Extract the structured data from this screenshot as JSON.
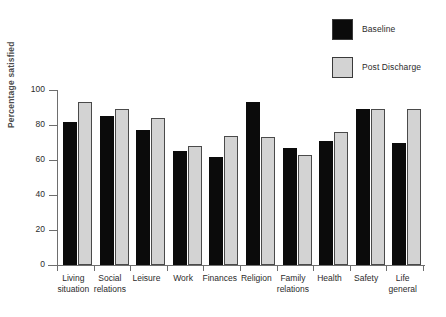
{
  "legend": {
    "position": "top-right",
    "items": [
      {
        "label": "Baseline",
        "color": "#0b0b0b",
        "swatch_name": "baseline-swatch"
      },
      {
        "label": "Post Discharge",
        "color": "#d3d3d3",
        "swatch_name": "post-discharge-swatch"
      }
    ]
  },
  "axes": {
    "y_title": "Percentage satisfied",
    "y_ticks": [
      "0",
      "20",
      "40",
      "60",
      "80",
      "100"
    ]
  },
  "chart_data": {
    "type": "bar",
    "title": "",
    "subtitle": "",
    "xlabel": "",
    "ylabel": "Percentage satisfied",
    "ylim": [
      0,
      100
    ],
    "yticks": [
      0,
      20,
      40,
      60,
      80,
      100
    ],
    "grid": false,
    "legend_position": "top-right",
    "categories": [
      "Living\nsituation",
      "Social\nrelations",
      "Leisure",
      "Work",
      "Finances",
      "Religion",
      "Family\nrelations",
      "Health",
      "Safety",
      "Life\ngeneral"
    ],
    "series": [
      {
        "name": "Baseline",
        "color": "#0b0b0b",
        "values": [
          82,
          85,
          77,
          65,
          62,
          93,
          67,
          71,
          89,
          70
        ]
      },
      {
        "name": "Post Discharge",
        "color": "#d3d3d3",
        "values": [
          93,
          89,
          84,
          68,
          74,
          73,
          63,
          76,
          89,
          89
        ]
      }
    ]
  }
}
